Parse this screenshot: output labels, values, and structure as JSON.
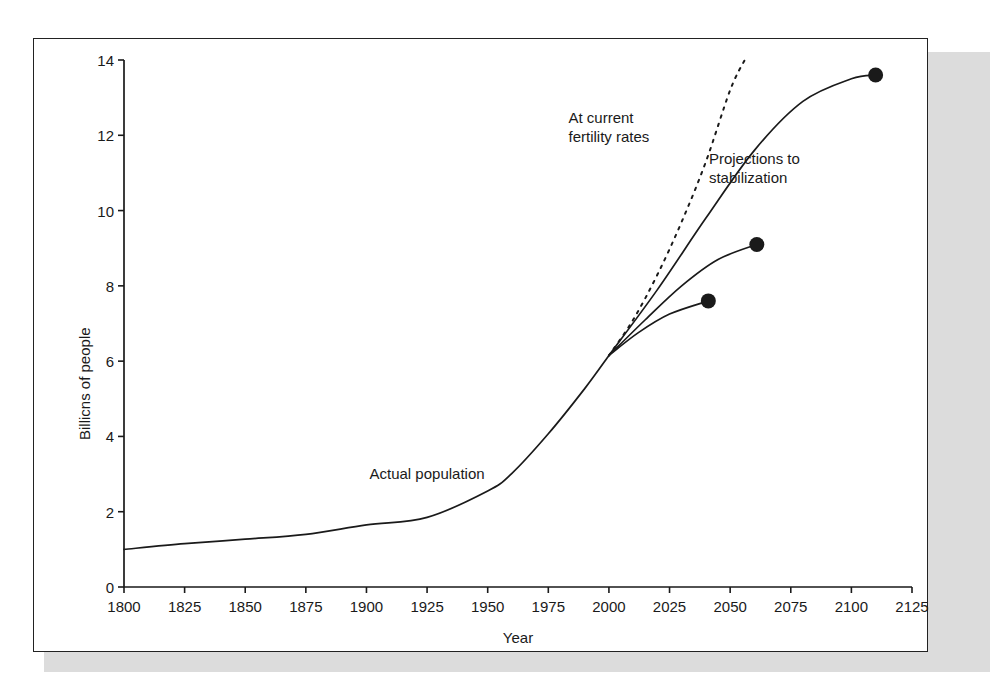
{
  "figure": {
    "background_color": "#ffffff",
    "frame_color": "#222222",
    "shadow_color": "#dcdcdc",
    "line_color": "#1a1a1a"
  },
  "chart_data": {
    "type": "line",
    "title": "",
    "xlabel": "Year",
    "ylabel": "Billions of people",
    "ylabel_rendered": "Billicns of people",
    "xlim": [
      1800,
      2125
    ],
    "ylim": [
      0,
      14
    ],
    "xticks": [
      1800,
      1825,
      1850,
      1875,
      1900,
      1925,
      1950,
      1975,
      2000,
      2025,
      2050,
      2075,
      2100,
      2125
    ],
    "yticks": [
      0,
      2,
      4,
      6,
      8,
      10,
      12,
      14
    ],
    "xtick_labels": [
      "1800",
      "1825",
      "1850",
      "1875",
      "1900",
      "1925",
      "1950",
      "1975",
      "2000",
      "2025",
      "2050",
      "2075",
      "2100",
      "2125"
    ],
    "ytick_labels": [
      "0",
      "2",
      "4",
      "6",
      "8",
      "10",
      "12",
      "14"
    ],
    "grid": false,
    "legend": false,
    "legend_position": "none",
    "series": [
      {
        "name": "Actual population",
        "style": "solid",
        "x": [
          1800,
          1825,
          1850,
          1875,
          1900,
          1925,
          1950,
          1960,
          1975,
          1990,
          2000
        ],
        "values": [
          1.0,
          1.15,
          1.27,
          1.4,
          1.65,
          1.85,
          2.55,
          3.02,
          4.07,
          5.27,
          6.15
        ]
      },
      {
        "name": "At current fertility rates",
        "style": "dotted",
        "x": [
          2000,
          2010,
          2020,
          2030,
          2040,
          2050,
          2056
        ],
        "values": [
          6.15,
          7.1,
          8.3,
          9.7,
          11.3,
          13.2,
          14.0
        ]
      },
      {
        "name": "High projection to stabilization",
        "style": "solid",
        "x": [
          2000,
          2020,
          2040,
          2060,
          2080,
          2100,
          2110
        ],
        "values": [
          6.15,
          7.9,
          9.8,
          11.6,
          12.9,
          13.5,
          13.6
        ],
        "endpoint": {
          "x": 2110,
          "y": 13.6,
          "marker": "dot"
        }
      },
      {
        "name": "Medium projection to stabilization",
        "style": "solid",
        "x": [
          2000,
          2015,
          2030,
          2045,
          2061
        ],
        "values": [
          6.15,
          7.1,
          8.0,
          8.7,
          9.1
        ],
        "endpoint": {
          "x": 2061,
          "y": 9.1,
          "marker": "dot"
        }
      },
      {
        "name": "Low projection to stabilization",
        "style": "solid",
        "x": [
          2000,
          2012,
          2025,
          2041
        ],
        "values": [
          6.15,
          6.75,
          7.25,
          7.6
        ],
        "endpoint": {
          "x": 2041,
          "y": 7.6,
          "marker": "dot"
        }
      }
    ],
    "annotations": [
      {
        "id": "actual-population",
        "text": "Actual population",
        "x": 1925,
        "y": 3.0
      },
      {
        "id": "at-current-fertility-rates",
        "text": "At current\nfertility rates",
        "x": 2000,
        "y": 12.2
      },
      {
        "id": "projections-to-stabilization",
        "text": "Projections to\nstabilization",
        "x": 2060,
        "y": 11.1
      }
    ],
    "markers": [
      {
        "id": "endpoint-high",
        "x": 2110,
        "y": 13.6
      },
      {
        "id": "endpoint-medium",
        "x": 2061,
        "y": 9.1
      },
      {
        "id": "endpoint-low",
        "x": 2041,
        "y": 7.6
      }
    ]
  }
}
